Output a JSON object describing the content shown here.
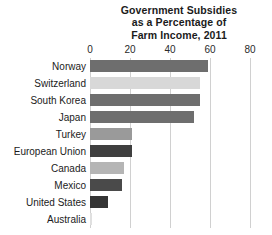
{
  "chart_data": {
    "type": "bar",
    "orientation": "horizontal",
    "title": "Government Subsidies as a Percentage of Farm Income, 2011",
    "title_lines": [
      "Government Subsidies",
      "as a Percentage of",
      "Farm Income, 2011"
    ],
    "xlabel": "",
    "ylabel": "",
    "xlim": [
      0,
      80
    ],
    "xticks": [
      0,
      20,
      40,
      60,
      80
    ],
    "xtick_labels": [
      "0",
      "20",
      "40",
      "60",
      "80"
    ],
    "grid": "vertical",
    "legend": "none",
    "categories": [
      "Norway",
      "Switzerland",
      "South Korea",
      "Japan",
      "Turkey",
      "European Union",
      "Canada",
      "Mexico",
      "United States",
      "Australia"
    ],
    "values": [
      59,
      55,
      55,
      52,
      21,
      21,
      17,
      16,
      9,
      1
    ],
    "bar_colors": [
      "#6e6e6e",
      "#d8d8d8",
      "#6e6e6e",
      "#6e6e6e",
      "#9a9a9a",
      "#3f3f3f",
      "#b5b5b5",
      "#4a4a4a",
      "#353535",
      "#e0e0e0"
    ]
  },
  "colors": {
    "background": "#ffffff",
    "gridline": "#d0d0d0",
    "text": "#1b1b1b"
  }
}
